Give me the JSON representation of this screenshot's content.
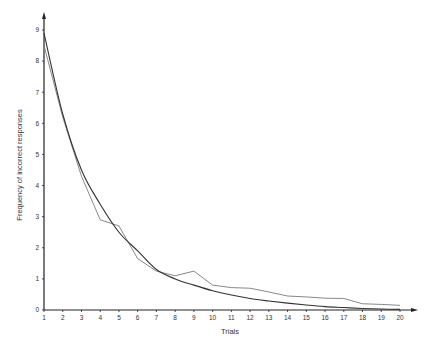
{
  "chart_data": {
    "type": "line",
    "title": "",
    "xlabel": "Trials",
    "ylabel": "Frequency of incorrect responses",
    "x": [
      1,
      2,
      3,
      4,
      5,
      6,
      7,
      8,
      9,
      10,
      11,
      12,
      13,
      14,
      15,
      16,
      17,
      18,
      19,
      20
    ],
    "xticks": [
      "1",
      "2",
      "3",
      "4",
      "5",
      "6",
      "7",
      "8",
      "9",
      "10",
      "11",
      "12",
      "13",
      "14",
      "15",
      "16",
      "17",
      "18",
      "19",
      "20"
    ],
    "yticks": [
      "0",
      "1",
      "2",
      "3",
      "4",
      "5",
      "6",
      "7",
      "8",
      "9"
    ],
    "xlim": [
      1,
      20
    ],
    "ylim": [
      0,
      9
    ],
    "grid": false,
    "legend": null,
    "series": [
      {
        "name": "observed",
        "style": "jagged",
        "color": "#7a7a7a",
        "values": [
          8.5,
          6.2,
          4.3,
          2.9,
          2.7,
          1.65,
          1.25,
          1.1,
          1.25,
          0.8,
          0.72,
          0.7,
          0.58,
          0.45,
          0.42,
          0.38,
          0.37,
          0.2,
          0.18,
          0.15
        ]
      },
      {
        "name": "theoretical",
        "style": "smooth",
        "color": "#333333",
        "values": [
          8.9,
          6.3,
          4.5,
          3.4,
          2.5,
          1.9,
          1.3,
          1.0,
          0.8,
          0.62,
          0.48,
          0.37,
          0.29,
          0.22,
          0.16,
          0.11,
          0.08,
          0.05,
          0.03,
          0.02
        ]
      }
    ]
  }
}
